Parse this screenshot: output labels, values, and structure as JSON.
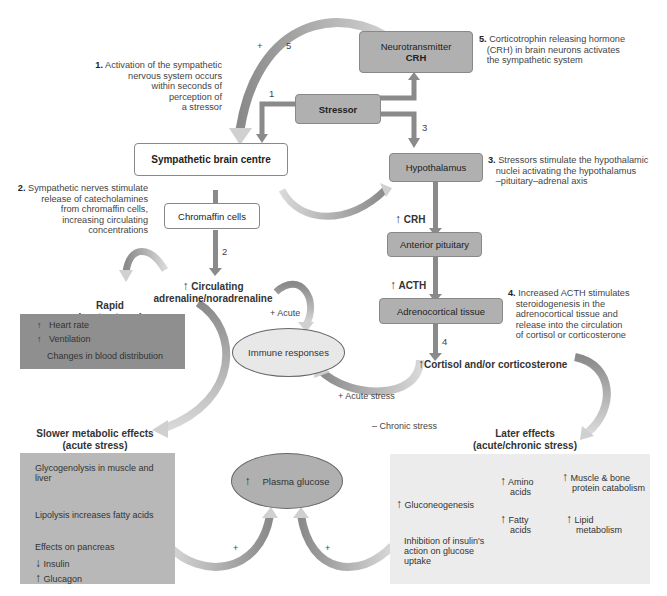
{
  "notes": {
    "n1": {
      "num": "1.",
      "text": "Activation of the sympathetic nervous system occurs within seconds of perception of a stressor",
      "lines": [
        "Activation of the sympathetic",
        "nervous system occurs",
        "within seconds of",
        "perception of",
        "a stressor"
      ]
    },
    "n2": {
      "num": "2.",
      "lines": [
        "Sympathetic nerves stimulate",
        "release of catecholamines",
        "from chromaffin cells,",
        "increasing circulating",
        "concentrations"
      ]
    },
    "n3": {
      "num": "3.",
      "lines": [
        "Stressors stimulate the hypothalamic",
        "nuclei activating the hypothalamus",
        "–pituitary–adrenal axis"
      ]
    },
    "n4": {
      "num": "4.",
      "lines": [
        "Increased ACTH stimulates",
        "steroidogenesis in the",
        "adrenocortical tissue and",
        "release into the circulation",
        "of cortisol or corticosterone"
      ]
    },
    "n5": {
      "num": "5.",
      "lines": [
        "Corticotrophin releasing hormone",
        "(CRH) in brain neurons activates",
        "the sympathetic system"
      ]
    }
  },
  "boxes": {
    "neurotransmitter": [
      "Neurotransmitter",
      "CRH"
    ],
    "stressor": "Stressor",
    "sympathetic": "Sympathetic brain centre",
    "hypothalamus": "Hypothalamus",
    "chromaffin": "Chromaffin cells",
    "anterior_pituitary": "Anterior pituitary",
    "adrenocortical": "Adrenocortical tissue"
  },
  "arrow_labels": {
    "one": "1",
    "two": "2",
    "three": "3",
    "four": "4",
    "five": "5",
    "plus_top": "+",
    "crh": "CRH",
    "acth": "ACTH",
    "up": "↑",
    "down": "↓",
    "acute": "+ Acute",
    "acute_stress": "+ Acute stress",
    "chronic_stress": "– Chronic stress",
    "plus_left": "+",
    "plus_right": "+"
  },
  "nodes": {
    "circulating": [
      "Circulating",
      "adrenaline/noradrenaline"
    ],
    "cortisol": "Cortisol and/or corticosterone",
    "immune": "Immune responses",
    "plasma_glucose": "Plasma glucose"
  },
  "rapid": {
    "title": [
      "Rapid",
      "(acute stress)"
    ],
    "items": [
      "Heart rate",
      "Ventilation",
      "Changes in blood distribution"
    ]
  },
  "slower": {
    "title": [
      "Slower metabolic effects",
      "(acute stress)"
    ],
    "items": [
      "Glycogenolysis in muscle and",
      "liver",
      "Lipolysis increases fatty acids",
      "Effects on pancreas",
      "Insulin",
      "Glucagon"
    ]
  },
  "later": {
    "title": [
      "Later effects",
      "(acute/chronic stress)"
    ],
    "gluconeogenesis": "Gluconeogenesis",
    "amino": [
      "Amino",
      "acids"
    ],
    "fatty": [
      "Fatty",
      "acids"
    ],
    "muscle": [
      "Muscle & bone",
      "protein catabolism"
    ],
    "lipid": [
      "Lipid",
      "metabolism"
    ],
    "inhibition": [
      "Inhibition of insulin's",
      "action on glucose",
      "uptake"
    ]
  },
  "colors": {
    "dark_box": "#b0b0b0",
    "rapid_panel": "#8f8f8f",
    "slow_panel": "#b8b8b8",
    "later_panel": "#ececec",
    "arrow_dark": "#8a8a8a",
    "arrow_light": "#d0d0d0"
  }
}
